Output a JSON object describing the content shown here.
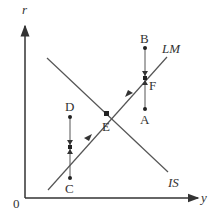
{
  "diagram": {
    "axes": {
      "y_label": "r",
      "x_label": "y",
      "origin_label": "0"
    },
    "curves": [
      {
        "id": "IS",
        "label": "IS",
        "slope": "downward"
      },
      {
        "id": "LM",
        "label": "LM",
        "slope": "upward"
      }
    ],
    "points": [
      {
        "label": "A",
        "desc": "below LM, right of E"
      },
      {
        "label": "B",
        "desc": "above LM, right of E"
      },
      {
        "label": "C",
        "desc": "below LM, left of E"
      },
      {
        "label": "D",
        "desc": "above LM, left of E"
      },
      {
        "label": "E",
        "desc": "IS-LM equilibrium"
      },
      {
        "label": "F",
        "desc": "on LM between A and B"
      }
    ],
    "colors": {
      "axis": "#333333",
      "line": "#555555",
      "point": "#222222"
    }
  }
}
